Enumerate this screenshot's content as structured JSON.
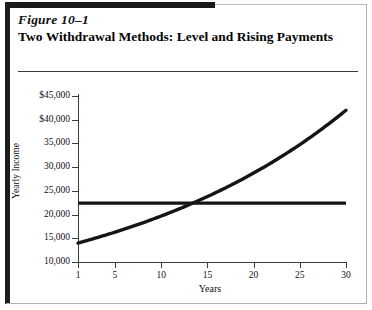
{
  "figure": {
    "number": "Figure 10–1",
    "title": "Two Withdrawal Methods:  Level and Rising Payments"
  },
  "chart_data": {
    "type": "line",
    "title": "Two Withdrawal Methods:  Level and Rising Payments",
    "xlabel": "Years",
    "ylabel": "Yearly Income",
    "xlim": [
      1,
      30
    ],
    "ylim": [
      10000,
      45000
    ],
    "grid": false,
    "legend": "none",
    "xticks": [
      1,
      5,
      10,
      15,
      20,
      25,
      30
    ],
    "xtick_labels": [
      "1",
      "5",
      "10",
      "15",
      "20",
      "25",
      "30"
    ],
    "yticks": [
      10000,
      15000,
      20000,
      25000,
      30000,
      35000,
      40000,
      45000
    ],
    "ytick_labels": [
      "10,000",
      "15,000",
      "20,000",
      "25,000",
      "30,000",
      "35,000",
      "$40,000",
      "$45,000"
    ],
    "series": [
      {
        "name": "Level Payments",
        "type": "line",
        "x": [
          1,
          30
        ],
        "values": [
          22400,
          22400
        ]
      },
      {
        "name": "Rising Payments",
        "type": "line",
        "x": [
          1,
          5,
          10,
          15,
          20,
          25,
          30
        ],
        "values": [
          14000,
          16300,
          19700,
          23800,
          28700,
          34700,
          42000
        ]
      }
    ],
    "annotations": [
      {
        "text": "crossover",
        "x": 14,
        "y": 22400
      }
    ]
  }
}
